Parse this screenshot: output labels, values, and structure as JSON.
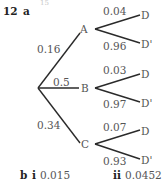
{
  "header": {
    "faint_number": "15",
    "question_number": "12",
    "part_a_label": "a"
  },
  "tree": {
    "first_stage": [
      {
        "event": "A",
        "probability": "0.16",
        "branches": [
          {
            "event": "D",
            "probability": "0.04"
          },
          {
            "event": "D'",
            "probability": "0.96"
          }
        ]
      },
      {
        "event": "B",
        "probability": "0.5",
        "branches": [
          {
            "event": "D",
            "probability": "0.03"
          },
          {
            "event": "D'",
            "probability": "0.97"
          }
        ]
      },
      {
        "event": "C",
        "probability": "0.34",
        "branches": [
          {
            "event": "D",
            "probability": "0.07"
          },
          {
            "event": "D'",
            "probability": "0.93"
          }
        ]
      }
    ]
  },
  "answers": {
    "part_b_label": "b",
    "i_label": "i",
    "i_value": "0.015",
    "ii_label": "ii",
    "ii_value": "0.0452"
  }
}
